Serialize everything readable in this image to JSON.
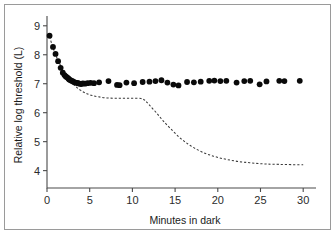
{
  "figure": {
    "background": "#ffffff",
    "border_color": "#9a9a9a"
  },
  "chart_data": {
    "type": "scatter",
    "title": "",
    "xlabel": "Minutes in dark",
    "ylabel": "Relative log threshold (L)",
    "xlim": [
      0,
      31.5
    ],
    "ylim": [
      3.4,
      9.2
    ],
    "xticks": [
      0,
      5,
      10,
      15,
      20,
      25,
      30
    ],
    "xticklabels": [
      "0",
      "5",
      "10",
      "15",
      "20",
      "25",
      "30"
    ],
    "yticks": [
      4,
      5,
      6,
      7,
      8,
      9
    ],
    "yticklabels": [
      "4",
      "5",
      "6",
      "7",
      "8",
      "9"
    ],
    "grid": false,
    "legend": null,
    "marker_color": "#0a0a0a",
    "marker_size": 4.2,
    "series": [
      {
        "name": "Measured threshold (cone plateau only)",
        "type": "scatter",
        "marker": "filled-circle",
        "x": [
          0.3,
          0.7,
          1.0,
          1.3,
          1.6,
          1.85,
          2.05,
          2.2,
          2.35,
          2.5,
          2.6,
          2.75,
          2.9,
          3.05,
          3.2,
          3.35,
          3.5,
          3.65,
          3.8,
          4.0,
          4.2,
          4.45,
          4.75,
          5.1,
          5.5,
          6.1,
          7.2,
          8.2,
          8.5,
          9.3,
          10.2,
          11.2,
          12.0,
          12.7,
          13.4,
          14.1,
          14.8,
          15.4,
          16.4,
          17.2,
          18.0,
          19.0,
          19.6,
          20.3,
          21.0,
          22.2,
          23.1,
          23.8,
          24.9,
          25.7,
          27.2,
          27.8,
          29.6
        ],
        "y": [
          8.66,
          8.27,
          8.03,
          7.78,
          7.55,
          7.38,
          7.3,
          7.25,
          7.22,
          7.18,
          7.15,
          7.12,
          7.1,
          7.08,
          7.05,
          7.04,
          7.03,
          7.02,
          7.0,
          6.99,
          7.01,
          7.0,
          7.02,
          7.03,
          7.02,
          7.05,
          7.09,
          6.96,
          6.95,
          7.04,
          7.02,
          7.06,
          7.07,
          7.09,
          7.12,
          7.04,
          6.97,
          6.94,
          7.06,
          7.05,
          7.07,
          7.1,
          7.11,
          7.09,
          7.1,
          7.04,
          7.09,
          7.1,
          6.98,
          7.08,
          7.1,
          7.09,
          7.1
        ]
      },
      {
        "name": "Normal biphasic dark-adaptation curve",
        "type": "line",
        "style": "dashed",
        "color": "#3a3a3a",
        "x": [
          0.3,
          0.8,
          1.3,
          1.8,
          2.3,
          2.8,
          3.3,
          3.9,
          4.5,
          5.2,
          6.0,
          7.0,
          8.0,
          9.0,
          10.0,
          11.0,
          11.5,
          12.0,
          12.8,
          13.6,
          14.5,
          15.5,
          16.5,
          17.5,
          18.5,
          19.5,
          20.5,
          21.5,
          22.5,
          23.5,
          24.5,
          25.5,
          26.5,
          28.0,
          30.0
        ],
        "y": [
          8.62,
          8.16,
          7.8,
          7.52,
          7.28,
          7.08,
          6.92,
          6.78,
          6.68,
          6.6,
          6.55,
          6.51,
          6.5,
          6.5,
          6.5,
          6.49,
          6.42,
          6.26,
          6.0,
          5.72,
          5.44,
          5.15,
          4.92,
          4.74,
          4.6,
          4.5,
          4.42,
          4.36,
          4.31,
          4.28,
          4.25,
          4.23,
          4.22,
          4.21,
          4.2
        ]
      }
    ]
  }
}
